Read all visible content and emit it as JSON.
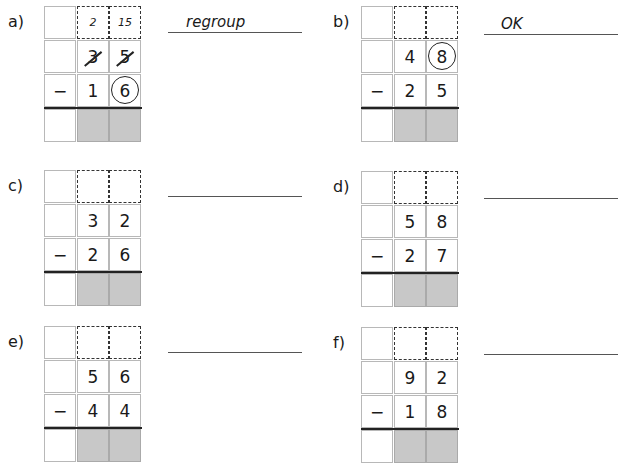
{
  "worksheet": {
    "problems": [
      {
        "label": "a)",
        "tens_carry": "2",
        "ones_carry": "15",
        "top_tens": "3",
        "top_ones": "5",
        "operator": "−",
        "bottom_tens": "1",
        "bottom_ones": "6",
        "answer": "regroup",
        "circled": "bottom_ones",
        "struck_out": [
          "top_tens",
          "top_ones"
        ]
      },
      {
        "label": "b)",
        "tens_carry": "",
        "ones_carry": "",
        "top_tens": "4",
        "top_ones": "8",
        "operator": "−",
        "bottom_tens": "2",
        "bottom_ones": "5",
        "answer": "OK",
        "circled": "top_ones",
        "struck_out": []
      },
      {
        "label": "c)",
        "tens_carry": "",
        "ones_carry": "",
        "top_tens": "3",
        "top_ones": "2",
        "operator": "−",
        "bottom_tens": "2",
        "bottom_ones": "6",
        "answer": "",
        "circled": null,
        "struck_out": []
      },
      {
        "label": "d)",
        "tens_carry": "",
        "ones_carry": "",
        "top_tens": "5",
        "top_ones": "8",
        "operator": "−",
        "bottom_tens": "2",
        "bottom_ones": "7",
        "answer": "",
        "circled": null,
        "struck_out": []
      },
      {
        "label": "e)",
        "tens_carry": "",
        "ones_carry": "",
        "top_tens": "5",
        "top_ones": "6",
        "operator": "−",
        "bottom_tens": "4",
        "bottom_ones": "4",
        "answer": "",
        "circled": null,
        "struck_out": []
      },
      {
        "label": "f)",
        "tens_carry": "",
        "ones_carry": "",
        "top_tens": "9",
        "top_ones": "2",
        "operator": "−",
        "bottom_tens": "1",
        "bottom_ones": "8",
        "answer": "",
        "circled": null,
        "struck_out": []
      }
    ]
  }
}
